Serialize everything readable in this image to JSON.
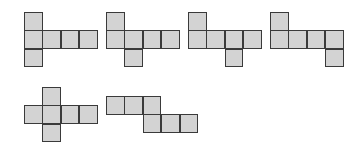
{
  "diagram": {
    "colors": {
      "fill": "#d3d3d3",
      "stroke": "#3a3a3a",
      "background": "#ffffff"
    },
    "nets": [
      {
        "id": "net-1",
        "cells": [
          [
            0,
            0
          ],
          [
            1,
            0
          ],
          [
            1,
            1
          ],
          [
            1,
            2
          ],
          [
            1,
            3
          ],
          [
            2,
            0
          ]
        ]
      },
      {
        "id": "net-2",
        "cells": [
          [
            0,
            0
          ],
          [
            1,
            0
          ],
          [
            1,
            1
          ],
          [
            1,
            2
          ],
          [
            1,
            3
          ],
          [
            2,
            1
          ]
        ]
      },
      {
        "id": "net-3",
        "cells": [
          [
            0,
            0
          ],
          [
            1,
            0
          ],
          [
            1,
            1
          ],
          [
            1,
            2
          ],
          [
            1,
            3
          ],
          [
            2,
            2
          ]
        ]
      },
      {
        "id": "net-4",
        "cells": [
          [
            0,
            0
          ],
          [
            1,
            0
          ],
          [
            1,
            1
          ],
          [
            1,
            2
          ],
          [
            1,
            3
          ],
          [
            2,
            3
          ]
        ]
      },
      {
        "id": "net-5",
        "cells": [
          [
            0,
            1
          ],
          [
            1,
            0
          ],
          [
            1,
            1
          ],
          [
            1,
            2
          ],
          [
            1,
            3
          ],
          [
            2,
            1
          ]
        ]
      },
      {
        "id": "net-6",
        "cells": [
          [
            0,
            0
          ],
          [
            0,
            1
          ],
          [
            0,
            2
          ],
          [
            1,
            2
          ],
          [
            1,
            3
          ],
          [
            1,
            4
          ]
        ]
      }
    ]
  }
}
